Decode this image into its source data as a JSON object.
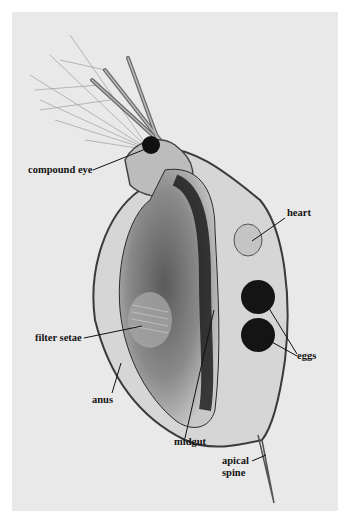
{
  "figure": {
    "background_color": "#e9e9e9",
    "labels": [
      {
        "id": "compound-eye",
        "text": "compound eye"
      },
      {
        "id": "heart",
        "text": "heart"
      },
      {
        "id": "eggs",
        "text": "eggs"
      },
      {
        "id": "filter-setae",
        "text": "filter setae"
      },
      {
        "id": "anus",
        "text": "anus"
      },
      {
        "id": "midgut",
        "text": "midgut"
      },
      {
        "id": "apical-spine",
        "text": "apical spine",
        "lines": [
          "apical",
          "spine"
        ]
      }
    ]
  }
}
